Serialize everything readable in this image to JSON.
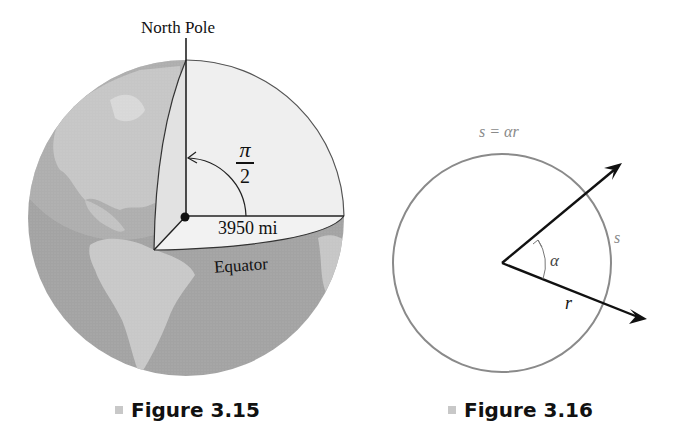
{
  "figure_3_15": {
    "caption": "Figure 3.15",
    "labels": {
      "north_pole": "North Pole",
      "angle_numerator": "π",
      "angle_denominator": "2",
      "radius": "3950 mi",
      "equator": "Equator"
    },
    "colors": {
      "globe_ocean": "#9a9a9a",
      "globe_land": "#c4c4c4",
      "wedge_fill": "#ececec",
      "line": "#222222"
    }
  },
  "figure_3_16": {
    "caption": "Figure 3.16",
    "labels": {
      "arc_formula": "s = αr",
      "arc": "s",
      "angle": "α",
      "radius": "r"
    },
    "colors": {
      "circle": "#8a8a8a",
      "arrows": "#111111",
      "formula_text": "#8a8a8a"
    }
  }
}
